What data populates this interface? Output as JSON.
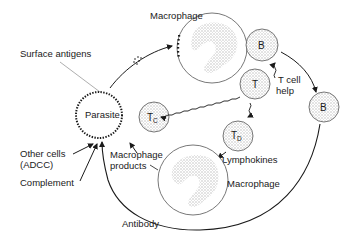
{
  "diagram": {
    "type": "immune-response-cycle",
    "colors": {
      "stroke": "#1a1a1a",
      "cell_outline": "#555555",
      "stipple": "#bdbdbd",
      "background": "#ffffff"
    },
    "nodes": {
      "parasite": {
        "label": "Parasite"
      },
      "macrophage_top": {
        "label": "Macrophage"
      },
      "macrophage_bottom": {
        "label": "Macrophage"
      },
      "b_cell_1": {
        "label": "B"
      },
      "b_cell_2": {
        "label": "B"
      },
      "t_cell": {
        "label": "T"
      },
      "tc_cell": {
        "label": "T",
        "subscript": "C"
      },
      "td_cell": {
        "label": "T",
        "subscript": "D"
      }
    },
    "labels": {
      "surface_antigens": "Surface antigens",
      "t_cell_help_1": "T cell",
      "t_cell_help_2": "help",
      "lymphokines": "Lymphokines",
      "macrophage_products_1": "Macrophage",
      "macrophage_products_2": "products",
      "other_cells_1": "Other cells",
      "other_cells_2": "(ADCC)",
      "complement": "Complement",
      "antibody": "Antibody"
    }
  }
}
